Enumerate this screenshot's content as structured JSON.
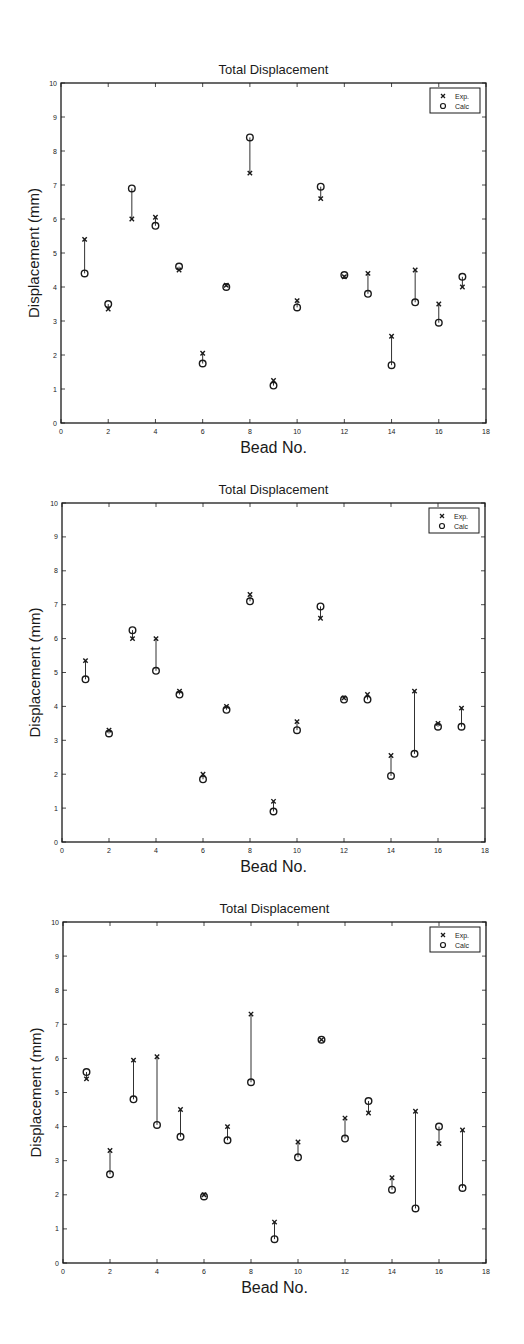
{
  "chart_data": [
    {
      "type": "scatter",
      "title": "Total Displacement",
      "xlabel": "Bead No.",
      "ylabel": "Displacement (mm)",
      "xlim": [
        0,
        18
      ],
      "ylim": [
        0,
        10
      ],
      "xticks": [
        0,
        2,
        4,
        6,
        8,
        10,
        12,
        14,
        16,
        18
      ],
      "yticks": [
        0,
        1,
        2,
        3,
        4,
        5,
        6,
        7,
        8,
        9,
        10
      ],
      "grid": false,
      "legend_position": "upper right",
      "connect_pairs": true,
      "x": [
        1,
        2,
        3,
        4,
        5,
        6,
        7,
        8,
        9,
        10,
        11,
        12,
        13,
        14,
        15,
        16,
        17
      ],
      "series": [
        {
          "name": "Exp.",
          "marker": "x",
          "values": [
            5.4,
            3.35,
            6.0,
            6.05,
            4.5,
            2.05,
            4.05,
            7.35,
            1.25,
            3.6,
            6.6,
            4.3,
            4.4,
            2.55,
            4.5,
            3.5,
            4.0
          ]
        },
        {
          "name": "Calc",
          "marker": "o",
          "values": [
            4.4,
            3.5,
            6.9,
            5.8,
            4.6,
            1.75,
            4.0,
            8.4,
            1.1,
            3.4,
            6.95,
            4.35,
            3.8,
            1.7,
            3.55,
            2.95,
            4.3
          ]
        }
      ]
    },
    {
      "type": "scatter",
      "title": "Total Displacement",
      "xlabel": "Bead No.",
      "ylabel": "Displacement (mm)",
      "xlim": [
        0,
        18
      ],
      "ylim": [
        0,
        10
      ],
      "xticks": [
        0,
        2,
        4,
        6,
        8,
        10,
        12,
        14,
        16,
        18
      ],
      "yticks": [
        0,
        1,
        2,
        3,
        4,
        5,
        6,
        7,
        8,
        9,
        10
      ],
      "grid": false,
      "legend_position": "upper right",
      "connect_pairs": true,
      "x": [
        1,
        2,
        3,
        4,
        5,
        6,
        7,
        8,
        9,
        10,
        11,
        12,
        13,
        14,
        15,
        16,
        17
      ],
      "series": [
        {
          "name": "Exp.",
          "marker": "x",
          "values": [
            5.35,
            3.3,
            6.0,
            6.0,
            4.45,
            2.0,
            4.0,
            7.3,
            1.2,
            3.55,
            6.6,
            4.25,
            4.35,
            2.55,
            4.45,
            3.5,
            3.95
          ]
        },
        {
          "name": "Calc",
          "marker": "o",
          "values": [
            4.8,
            3.2,
            6.25,
            5.05,
            4.35,
            1.85,
            3.9,
            7.1,
            0.9,
            3.3,
            6.95,
            4.2,
            4.2,
            1.95,
            2.6,
            3.4,
            3.4
          ]
        }
      ]
    },
    {
      "type": "scatter",
      "title": "Total Displacement",
      "xlabel": "Bead No.",
      "ylabel": "Displacement (mm)",
      "xlim": [
        0,
        18
      ],
      "ylim": [
        0,
        10
      ],
      "xticks": [
        0,
        2,
        4,
        6,
        8,
        10,
        12,
        14,
        16,
        18
      ],
      "yticks": [
        0,
        1,
        2,
        3,
        4,
        5,
        6,
        7,
        8,
        9,
        10
      ],
      "grid": false,
      "legend_position": "upper right",
      "connect_pairs": true,
      "x": [
        1,
        2,
        3,
        4,
        5,
        6,
        7,
        8,
        9,
        10,
        11,
        12,
        13,
        14,
        15,
        16,
        17
      ],
      "series": [
        {
          "name": "Exp.",
          "marker": "x",
          "values": [
            5.4,
            3.3,
            5.95,
            6.05,
            4.5,
            2.0,
            4.0,
            7.3,
            1.2,
            3.55,
            6.55,
            4.25,
            4.4,
            2.5,
            4.45,
            3.5,
            3.9
          ]
        },
        {
          "name": "Calc",
          "marker": "o",
          "values": [
            5.6,
            2.6,
            4.8,
            4.05,
            3.7,
            1.95,
            3.6,
            5.3,
            0.7,
            3.1,
            6.55,
            3.65,
            4.75,
            2.15,
            1.6,
            4.0,
            2.2
          ]
        }
      ]
    }
  ],
  "colors": {
    "ink": "#1a1a1a",
    "background": "#ffffff"
  }
}
